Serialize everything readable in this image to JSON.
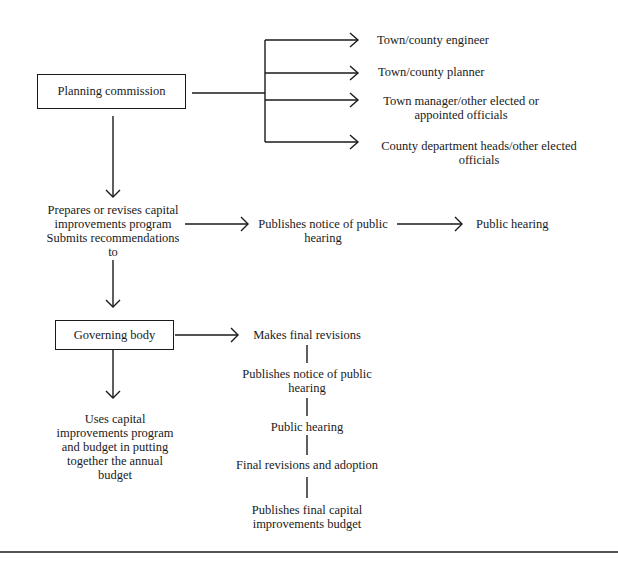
{
  "diagram": {
    "type": "flowchart",
    "nodes": {
      "planning_commission": "Planning commission",
      "engineer": "Town/county engineer",
      "planner": "Town/county planner",
      "town_manager": [
        "Town manager/other elected or",
        "appointed officials"
      ],
      "county_heads": [
        "County department heads/other elected",
        "officials"
      ],
      "prepares": [
        "Prepares or revises capital",
        "improvements program",
        "Submits recommendations",
        "to"
      ],
      "publishes_notice_1": [
        "Publishes notice of public",
        "hearing"
      ],
      "public_hearing_1": "Public hearing",
      "governing_body": "Governing body",
      "uses_cip": [
        "Uses capital",
        "improvements program",
        "and budget in putting",
        "together the annual",
        "budget"
      ],
      "makes_final": "Makes final revisions",
      "publishes_notice_2": [
        "Publishes notice of public",
        "hearing"
      ],
      "public_hearing_2": "Public hearing",
      "final_adoption": "Final revisions and adoption",
      "publishes_final": [
        "Publishes final capital",
        "improvements budget"
      ]
    },
    "edges": [
      [
        "planning_commission",
        "engineer"
      ],
      [
        "planning_commission",
        "planner"
      ],
      [
        "planning_commission",
        "town_manager"
      ],
      [
        "planning_commission",
        "county_heads"
      ],
      [
        "planning_commission",
        "prepares"
      ],
      [
        "prepares",
        "publishes_notice_1"
      ],
      [
        "publishes_notice_1",
        "public_hearing_1"
      ],
      [
        "prepares",
        "governing_body"
      ],
      [
        "governing_body",
        "makes_final"
      ],
      [
        "governing_body",
        "uses_cip"
      ],
      [
        "makes_final",
        "publishes_notice_2"
      ],
      [
        "publishes_notice_2",
        "public_hearing_2"
      ],
      [
        "public_hearing_2",
        "final_adoption"
      ],
      [
        "final_adoption",
        "publishes_final"
      ]
    ]
  }
}
